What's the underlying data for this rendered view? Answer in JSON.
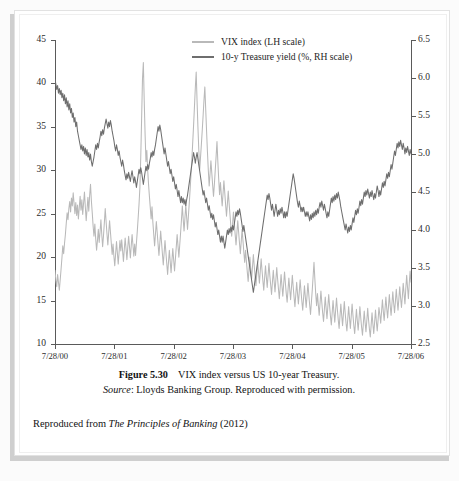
{
  "figure": {
    "number_label": "Figure 5.30",
    "title_text": "VIX index versus US 10-year Treasury.",
    "source_prefix": "Source",
    "source_text": ": Lloyds Banking Group. Reproduced with permission."
  },
  "attribution": {
    "prefix": "Reproduced from ",
    "book_title": "The Principles of Banking",
    "suffix": " (2012)"
  },
  "legend": {
    "position": "top-center",
    "items": [
      {
        "label": "VIX index (LH scale)",
        "color": "#b9b9b9"
      },
      {
        "label": "10-y Treasure yield (%, RH scale)",
        "color": "#6e6e6e"
      }
    ]
  },
  "chart_data": {
    "type": "line",
    "title": "VIX index versus US 10-year Treasury.",
    "xlabel": "",
    "ylabel": "VIX index",
    "y2label": "10-y Treasury yield (%)",
    "grid": false,
    "legend_position": "top-center",
    "xlim": [
      "7/28/00",
      "7/28/06"
    ],
    "ylim": [
      10,
      45
    ],
    "y2lim": [
      2.5,
      6.5
    ],
    "yticks": [
      10,
      15,
      20,
      25,
      30,
      35,
      40,
      45
    ],
    "y2ticks": [
      2.5,
      3.0,
      3.5,
      4.0,
      4.5,
      5.0,
      5.5,
      6.0,
      6.5
    ],
    "xticks": [
      "7/28/00",
      "7/28/01",
      "7/28/02",
      "7/28/03",
      "7/28/04",
      "7/28/05",
      "7/28/06"
    ],
    "series": [
      {
        "name": "VIX index (LH scale)",
        "axis": "left",
        "color": "#b9b9b9",
        "values": [
          18.5,
          17.3,
          16.6,
          18.0,
          17.1,
          16.2,
          17.4,
          18.6,
          19.9,
          21.3,
          20.4,
          21.6,
          22.6,
          23.9,
          25.1,
          24.3,
          25.6,
          26.4,
          25.2,
          26.8,
          25.9,
          27.4,
          26.2,
          25.0,
          26.3,
          24.8,
          26.0,
          24.4,
          25.7,
          27.0,
          25.4,
          26.6,
          24.9,
          26.2,
          27.5,
          25.8,
          24.2,
          25.5,
          26.9,
          25.3,
          27.1,
          28.4,
          26.5,
          25.1,
          23.6,
          22.4,
          23.8,
          22.1,
          20.8,
          21.9,
          23.2,
          21.7,
          22.9,
          24.3,
          22.6,
          21.2,
          22.5,
          24.0,
          25.6,
          24.1,
          22.7,
          21.4,
          22.8,
          24.2,
          22.9,
          21.6,
          20.3,
          21.5,
          20.1,
          19.0,
          20.4,
          21.8,
          20.5,
          19.2,
          20.6,
          21.9,
          20.7,
          22.0,
          20.8,
          19.5,
          20.9,
          22.2,
          21.0,
          19.7,
          21.1,
          22.4,
          21.2,
          19.9,
          21.3,
          22.6,
          21.4,
          20.1,
          21.5,
          20.2,
          21.6,
          23.0,
          24.5,
          26.1,
          28.0,
          31.5,
          36.0,
          40.5,
          42.4,
          38.0,
          34.2,
          31.0,
          32.3,
          30.0,
          28.4,
          27.0,
          25.7,
          24.4,
          25.8,
          24.0,
          22.6,
          21.3,
          22.7,
          24.1,
          22.8,
          21.5,
          20.2,
          21.6,
          23.0,
          21.7,
          20.4,
          19.1,
          20.5,
          21.9,
          20.6,
          19.3,
          18.0,
          19.4,
          20.8,
          19.5,
          18.2,
          19.6,
          21.0,
          19.7,
          18.4,
          19.8,
          21.2,
          22.6,
          21.3,
          20.0,
          21.4,
          22.8,
          24.3,
          25.9,
          24.4,
          23.0,
          24.5,
          26.0,
          24.6,
          23.2,
          24.7,
          26.2,
          27.8,
          29.5,
          31.3,
          33.2,
          35.2,
          37.3,
          39.5,
          41.3,
          38.0,
          35.0,
          32.4,
          30.0,
          31.5,
          33.0,
          34.6,
          36.3,
          38.1,
          39.6,
          37.0,
          34.5,
          32.1,
          30.0,
          28.2,
          29.6,
          31.1,
          29.7,
          28.3,
          27.0,
          28.4,
          30.0,
          31.6,
          33.3,
          31.0,
          29.0,
          27.2,
          28.6,
          27.2,
          25.9,
          27.3,
          28.8,
          27.4,
          26.0,
          24.7,
          26.1,
          27.6,
          26.2,
          24.9,
          23.6,
          22.4,
          23.8,
          25.2,
          23.9,
          22.6,
          21.4,
          22.8,
          24.2,
          22.9,
          21.6,
          20.4,
          21.8,
          23.2,
          21.9,
          20.6,
          19.4,
          20.8,
          19.5,
          18.3,
          17.2,
          18.6,
          20.0,
          18.7,
          17.5,
          18.9,
          20.3,
          19.0,
          17.8,
          16.7,
          18.1,
          19.5,
          18.2,
          17.0,
          18.4,
          19.8,
          18.5,
          17.3,
          16.2,
          17.6,
          19.0,
          17.7,
          16.5,
          17.9,
          19.3,
          17.9,
          16.8,
          15.7,
          17.1,
          18.5,
          17.2,
          16.0,
          17.4,
          18.8,
          17.5,
          16.3,
          15.2,
          16.6,
          18.0,
          16.7,
          15.5,
          16.9,
          18.3,
          17.0,
          15.8,
          14.8,
          16.2,
          17.6,
          16.3,
          15.1,
          16.5,
          17.9,
          16.6,
          15.4,
          14.3,
          15.7,
          17.1,
          15.8,
          14.6,
          16.0,
          17.4,
          16.1,
          14.9,
          13.9,
          15.3,
          16.7,
          15.4,
          14.2,
          15.6,
          17.0,
          15.7,
          14.5,
          13.4,
          14.8,
          16.2,
          17.8,
          19.4,
          17.5,
          15.8,
          14.4,
          15.8,
          14.5,
          13.3,
          14.7,
          16.1,
          14.8,
          13.6,
          12.6,
          14.0,
          15.4,
          14.1,
          12.9,
          14.3,
          15.7,
          14.4,
          13.2,
          12.2,
          13.6,
          15.0,
          13.7,
          12.5,
          13.9,
          15.3,
          14.0,
          12.8,
          11.8,
          13.2,
          14.6,
          13.3,
          12.1,
          13.5,
          14.9,
          13.6,
          12.4,
          11.5,
          12.9,
          14.3,
          13.0,
          11.8,
          13.2,
          14.6,
          13.3,
          12.1,
          11.2,
          12.6,
          14.0,
          12.7,
          11.6,
          12.9,
          14.3,
          13.0,
          11.9,
          11.0,
          12.4,
          13.8,
          12.5,
          11.4,
          12.7,
          14.1,
          12.8,
          11.7,
          10.8,
          12.2,
          13.6,
          12.3,
          11.2,
          12.5,
          13.9,
          12.6,
          11.5,
          12.8,
          14.2,
          13.4,
          12.4,
          13.7,
          15.1,
          13.8,
          12.7,
          14.0,
          15.4,
          14.1,
          13.0,
          14.3,
          15.7,
          14.4,
          13.3,
          14.6,
          16.0,
          14.7,
          13.6,
          14.9,
          16.3,
          15.0,
          13.9,
          15.2,
          16.6,
          15.3,
          14.2,
          15.5,
          17.0,
          15.8,
          14.6,
          16.4,
          17.9,
          16.5,
          15.2,
          17.0,
          18.4,
          17.1
        ]
      },
      {
        "name": "10-y Treasure yield (%, RH scale)",
        "axis": "right",
        "color": "#6e6e6e",
        "values": [
          5.98,
          5.92,
          5.85,
          5.9,
          5.8,
          5.86,
          5.78,
          5.84,
          5.74,
          5.8,
          5.7,
          5.78,
          5.66,
          5.74,
          5.62,
          5.7,
          5.58,
          5.66,
          5.54,
          5.6,
          5.48,
          5.54,
          5.42,
          5.48,
          5.36,
          5.42,
          5.3,
          5.24,
          5.18,
          5.12,
          5.06,
          5.12,
          5.04,
          5.1,
          5.0,
          5.08,
          4.98,
          5.06,
          4.96,
          5.02,
          4.92,
          5.0,
          4.9,
          4.84,
          4.9,
          4.96,
          5.04,
          5.12,
          5.06,
          5.14,
          5.08,
          5.16,
          5.22,
          5.3,
          5.24,
          5.32,
          5.26,
          5.34,
          5.4,
          5.46,
          5.4,
          5.34,
          5.42,
          5.36,
          5.44,
          5.38,
          5.3,
          5.24,
          5.18,
          5.1,
          5.04,
          5.12,
          5.06,
          4.98,
          5.04,
          4.96,
          4.9,
          4.84,
          4.92,
          4.86,
          4.78,
          4.72,
          4.66,
          4.74,
          4.68,
          4.76,
          4.7,
          4.64,
          4.72,
          4.78,
          4.7,
          4.62,
          4.7,
          4.64,
          4.56,
          4.64,
          4.72,
          4.8,
          4.74,
          4.82,
          4.76,
          4.68,
          4.6,
          4.68,
          4.76,
          4.84,
          4.78,
          4.86,
          4.8,
          4.88,
          4.94,
          5.02,
          4.96,
          5.04,
          4.98,
          5.06,
          5.12,
          5.2,
          5.28,
          5.36,
          5.3,
          5.38,
          5.32,
          5.24,
          5.16,
          5.08,
          5.0,
          5.08,
          5.0,
          4.92,
          4.84,
          4.9,
          4.82,
          4.74,
          4.8,
          4.72,
          4.64,
          4.7,
          4.62,
          4.54,
          4.6,
          4.52,
          4.44,
          4.52,
          4.44,
          4.36,
          4.44,
          4.36,
          4.42,
          4.34,
          4.4,
          4.32,
          4.4,
          4.46,
          4.54,
          4.62,
          4.7,
          4.78,
          4.86,
          4.94,
          5.02,
          4.96,
          4.88,
          4.96,
          5.02,
          4.94,
          4.86,
          4.78,
          4.7,
          4.62,
          4.54,
          4.46,
          4.52,
          4.44,
          4.36,
          4.42,
          4.34,
          4.26,
          4.32,
          4.24,
          4.16,
          4.22,
          4.14,
          4.2,
          4.12,
          4.04,
          4.1,
          4.02,
          3.94,
          4.0,
          3.92,
          3.84,
          3.92,
          3.84,
          3.92,
          3.84,
          3.76,
          3.84,
          3.92,
          4.0,
          3.94,
          4.02,
          3.96,
          4.04,
          3.98,
          4.06,
          4.0,
          4.08,
          4.16,
          4.24,
          4.18,
          4.26,
          4.2,
          4.28,
          4.22,
          4.14,
          4.06,
          3.98,
          4.06,
          3.98,
          3.9,
          3.82,
          3.74,
          3.66,
          3.58,
          3.5,
          3.42,
          3.34,
          3.26,
          3.18,
          3.26,
          3.34,
          3.42,
          3.5,
          3.58,
          3.66,
          3.74,
          3.82,
          3.9,
          3.98,
          4.06,
          4.14,
          4.22,
          4.3,
          4.38,
          4.46,
          4.4,
          4.48,
          4.42,
          4.34,
          4.26,
          4.34,
          4.26,
          4.18,
          4.26,
          4.34,
          4.26,
          4.18,
          4.26,
          4.2,
          4.28,
          4.22,
          4.3,
          4.24,
          4.16,
          4.24,
          4.16,
          4.24,
          4.18,
          4.26,
          4.34,
          4.42,
          4.5,
          4.58,
          4.66,
          4.74,
          4.68,
          4.6,
          4.52,
          4.44,
          4.36,
          4.3,
          4.38,
          4.32,
          4.24,
          4.3,
          4.24,
          4.3,
          4.24,
          4.18,
          4.24,
          4.18,
          4.24,
          4.18,
          4.12,
          4.2,
          4.14,
          4.22,
          4.16,
          4.24,
          4.18,
          4.26,
          4.2,
          4.28,
          4.22,
          4.3,
          4.36,
          4.3,
          4.38,
          4.32,
          4.26,
          4.34,
          4.28,
          4.22,
          4.16,
          4.24,
          4.18,
          4.26,
          4.34,
          4.42,
          4.36,
          4.44,
          4.38,
          4.46,
          4.4,
          4.48,
          4.42,
          4.5,
          4.44,
          4.38,
          4.3,
          4.24,
          4.18,
          4.12,
          4.06,
          4.0,
          4.08,
          4.02,
          3.96,
          4.04,
          3.98,
          4.06,
          4.0,
          4.08,
          4.16,
          4.1,
          4.18,
          4.26,
          4.2,
          4.28,
          4.22,
          4.3,
          4.38,
          4.32,
          4.4,
          4.34,
          4.42,
          4.5,
          4.44,
          4.52,
          4.46,
          4.54,
          4.48,
          4.42,
          4.5,
          4.44,
          4.52,
          4.46,
          4.4,
          4.48,
          4.42,
          4.5,
          4.58,
          4.52,
          4.44,
          4.52,
          4.46,
          4.54,
          4.62,
          4.56,
          4.64,
          4.58,
          4.66,
          4.74,
          4.68,
          4.76,
          4.7,
          4.78,
          4.86,
          4.8,
          4.88,
          4.96,
          5.04,
          4.98,
          5.06,
          5.14,
          5.08,
          5.16,
          5.1,
          5.18,
          5.12,
          5.06,
          5.14,
          5.08,
          5.0,
          5.08,
          5.02,
          5.1,
          5.04,
          4.98,
          5.06,
          5.0
        ]
      }
    ]
  }
}
